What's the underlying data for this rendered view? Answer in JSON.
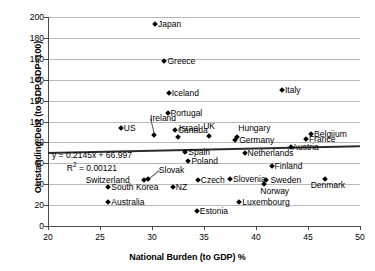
{
  "chart_data": {
    "type": "scatter",
    "title": "",
    "xlabel": "National Burden (to GDP) %",
    "ylabel": "Outstanding Debt (to GDP,GDP=100)",
    "xlim": [
      20,
      50
    ],
    "ylim": [
      0,
      200
    ],
    "xticks": [
      20,
      25,
      30,
      35,
      40,
      45,
      50
    ],
    "yticks": [
      0,
      20,
      40,
      60,
      80,
      100,
      120,
      140,
      160,
      180,
      200
    ],
    "grid": true,
    "legend": "none",
    "trendline": {
      "equation": "y = 0.2145x + 66.997",
      "r2_label": "R",
      "r2_sup": "2",
      "r2_value": "= 0.00121",
      "slope": 0.2145,
      "intercept": 66.997,
      "r_squared": 0.00121
    },
    "points": [
      {
        "label": "Japan",
        "x": 30.3,
        "y": 193,
        "lx": 3,
        "ly": -4
      },
      {
        "label": "Greece",
        "x": 31.2,
        "y": 158,
        "lx": 3,
        "ly": -4
      },
      {
        "label": "Iceland",
        "x": 31.6,
        "y": 127,
        "lx": 3,
        "ly": -4
      },
      {
        "label": "Italy",
        "x": 42.5,
        "y": 130,
        "lx": 3,
        "ly": -4
      },
      {
        "label": "Portugal",
        "x": 31.5,
        "y": 108,
        "lx": 3,
        "ly": -4
      },
      {
        "label": "US",
        "x": 27.0,
        "y": 94,
        "lx": 3,
        "ly": -4
      },
      {
        "label": "Ireland",
        "x": 30.2,
        "y": 87,
        "lx": -4,
        "ly": -21,
        "leader": true
      },
      {
        "label": "Canada",
        "x": 32.2,
        "y": 92,
        "lx": 3,
        "ly": -4
      },
      {
        "label": "UK",
        "x": 35.5,
        "y": 86,
        "lx": -6,
        "ly": -14
      },
      {
        "label": "Hungary",
        "x": 38.2,
        "y": 85,
        "lx": 1,
        "ly": -13
      },
      {
        "label": "Germany",
        "x": 38.0,
        "y": 82,
        "lx": 4,
        "ly": -4
      },
      {
        "label": "Belgiium",
        "x": 45.3,
        "y": 88,
        "lx": 3,
        "ly": -4
      },
      {
        "label": "France",
        "x": 44.8,
        "y": 83,
        "lx": 3,
        "ly": -4
      },
      {
        "label": "Austria",
        "x": 43.4,
        "y": 76,
        "lx": 1,
        "ly": -4
      },
      {
        "label": "Israel",
        "x": 32.5,
        "y": 85,
        "lx": 1,
        "ly": -13
      },
      {
        "label": "Spain",
        "x": 33.2,
        "y": 71,
        "lx": 3,
        "ly": -4
      },
      {
        "label": "Netherlands",
        "x": 38.9,
        "y": 70,
        "lx": 3,
        "ly": -4
      },
      {
        "label": "Poland",
        "x": 33.5,
        "y": 62,
        "lx": 3,
        "ly": -4
      },
      {
        "label": "Finland",
        "x": 41.5,
        "y": 57,
        "lx": 3,
        "ly": -4
      },
      {
        "label": "Slovak",
        "x": 29.6,
        "y": 45,
        "lx": 11,
        "ly": -13,
        "leader": true
      },
      {
        "label": "Switzerland",
        "x": 29.2,
        "y": 44,
        "lx": -58,
        "ly": -4
      },
      {
        "label": "Czech",
        "x": 34.4,
        "y": 44,
        "lx": 3,
        "ly": -4
      },
      {
        "label": "Slovenia",
        "x": 37.5,
        "y": 45,
        "lx": 3,
        "ly": -4
      },
      {
        "label": "Sweden",
        "x": 41.0,
        "y": 44,
        "lx": 4,
        "ly": -4
      },
      {
        "label": "Denmark",
        "x": 46.6,
        "y": 45,
        "lx": -14,
        "ly": 2
      },
      {
        "label": "South Korea",
        "x": 25.8,
        "y": 37,
        "lx": 3,
        "ly": -4
      },
      {
        "label": "NZ",
        "x": 32.0,
        "y": 37,
        "lx": 3,
        "ly": -4
      },
      {
        "label": "Norway",
        "x": 40.8,
        "y": 40,
        "lx": -4,
        "ly": 3
      },
      {
        "label": "Australia",
        "x": 25.8,
        "y": 23,
        "lx": 3,
        "ly": -4
      },
      {
        "label": "Luxembourg",
        "x": 38.4,
        "y": 23,
        "lx": 3,
        "ly": -4
      },
      {
        "label": "Estonia",
        "x": 34.3,
        "y": 14,
        "lx": 3,
        "ly": -4
      }
    ]
  }
}
